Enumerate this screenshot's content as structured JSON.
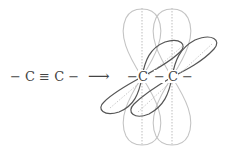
{
  "diagram": {
    "left_formula": "− C ≡ C −",
    "arrow": "⟶",
    "right_carbon_1": "C",
    "right_carbon_2": "C",
    "bond_left": "−",
    "bond_middle": "−",
    "bond_right": "−"
  },
  "colors": {
    "vertical_lobes": "#c4c4c4",
    "diagonal_lobes": "#555555",
    "text": "#444444"
  }
}
